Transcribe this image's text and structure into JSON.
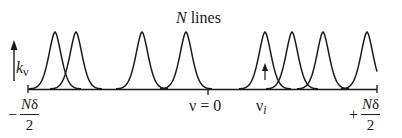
{
  "title": {
    "italic_part": "N",
    "rest": " lines"
  },
  "y_axis": {
    "symbol": "k",
    "subscript": "ν"
  },
  "axis": {
    "left_label": {
      "sign": "−",
      "numerator_italic": "N",
      "numerator_rest": "δ",
      "denominator": "2"
    },
    "right_label": {
      "sign": "+",
      "numerator_italic": "N",
      "numerator_rest": "δ",
      "denominator": "2"
    },
    "zero_label": "ν = 0",
    "line_label": {
      "symbol": "ν",
      "subscript": "i"
    }
  },
  "lines": {
    "count_label": "N",
    "peak_positions_px": [
      55,
      76,
      142,
      186,
      265,
      292,
      323,
      367
    ],
    "highlighted_index": 4
  },
  "colors": {
    "stroke": "#1a1a1a",
    "background": "#ffffff"
  }
}
